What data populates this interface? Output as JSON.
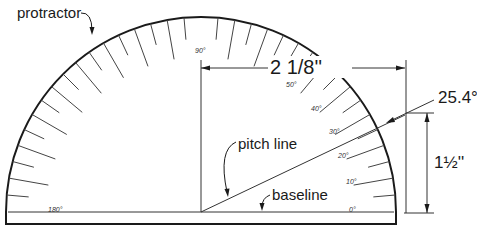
{
  "diagram": {
    "labels": {
      "protractor": "protractor",
      "pitch_line": "pitch line",
      "baseline": "baseline",
      "horizontal_dimension": "2 1/8''",
      "vertical_dimension": "1½''",
      "angle": "25.4°"
    },
    "scale_labels": {
      "deg0": "0°",
      "deg10": "10°",
      "deg20": "20°",
      "deg30": "30°",
      "deg40": "40°",
      "deg50": "50°",
      "deg90": "90°",
      "deg180": "180°"
    },
    "colors": {
      "line": "#1a1a1a",
      "background": "#ffffff"
    }
  }
}
